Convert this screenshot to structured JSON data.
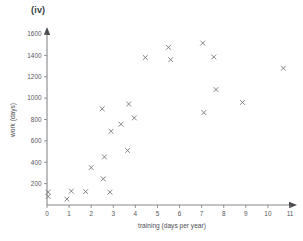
{
  "chart_data": {
    "type": "scatter",
    "title": "(iv)",
    "xlabel": "training (days per year)",
    "ylabel": "work (days)",
    "xlim": [
      0,
      11.4
    ],
    "ylim": [
      0,
      1660
    ],
    "xticks": [
      0,
      1,
      2,
      3,
      4,
      5,
      6,
      7,
      8,
      9,
      10,
      11
    ],
    "yticks": [
      200,
      400,
      600,
      800,
      1000,
      1200,
      1400,
      1600
    ],
    "xtick_labels": [
      "0",
      "1",
      "2",
      "3",
      "4",
      "5",
      "6",
      "7",
      "8",
      "9",
      "10",
      "11"
    ],
    "ytick_labels": [
      "200",
      "400",
      "600",
      "800",
      "1000",
      "1200",
      "1400",
      "1600"
    ],
    "grid": false,
    "legend": null,
    "marker": "x",
    "marker_color": "#6e6f73",
    "axis_color": "#86878b",
    "background_color": "#ffffff",
    "points": [
      {
        "x": 0.05,
        "y": 120
      },
      {
        "x": 0.05,
        "y": 80
      },
      {
        "x": 0.9,
        "y": 55
      },
      {
        "x": 1.1,
        "y": 130
      },
      {
        "x": 1.75,
        "y": 125
      },
      {
        "x": 2.0,
        "y": 350
      },
      {
        "x": 2.5,
        "y": 900
      },
      {
        "x": 2.55,
        "y": 245
      },
      {
        "x": 2.6,
        "y": 450
      },
      {
        "x": 2.85,
        "y": 120
      },
      {
        "x": 2.9,
        "y": 690
      },
      {
        "x": 3.35,
        "y": 755
      },
      {
        "x": 3.65,
        "y": 510
      },
      {
        "x": 3.7,
        "y": 945
      },
      {
        "x": 3.95,
        "y": 815
      },
      {
        "x": 4.45,
        "y": 1380
      },
      {
        "x": 5.5,
        "y": 1475
      },
      {
        "x": 5.6,
        "y": 1360
      },
      {
        "x": 7.05,
        "y": 1515
      },
      {
        "x": 7.1,
        "y": 865
      },
      {
        "x": 7.55,
        "y": 1385
      },
      {
        "x": 7.65,
        "y": 1080
      },
      {
        "x": 8.85,
        "y": 960
      },
      {
        "x": 10.7,
        "y": 1280
      }
    ]
  }
}
